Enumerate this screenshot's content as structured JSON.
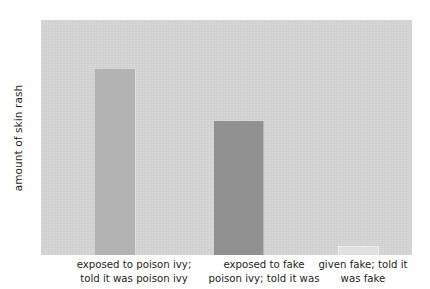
{
  "chart_data": {
    "type": "bar",
    "title": "",
    "subtitle": "",
    "xlabel": "",
    "ylabel": "amount of skin rash",
    "categories": [
      "exposed to poison ivy; told it was poison ivy",
      "exposed to fake poison ivy; told it was",
      "given fake; told it was fake"
    ],
    "values": [
      79,
      57,
      4
    ],
    "ylim": [
      0,
      100
    ],
    "grid": false,
    "legend": "none",
    "axis_tick_labels": [],
    "series": [
      {
        "name": "amount of skin rash",
        "values": [
          79,
          57,
          4
        ]
      }
    ],
    "bar_colors": [
      "#b3b3b3",
      "#919191",
      "#e0e0e0"
    ],
    "plot_background": "#d6d6d6",
    "figure_background": "#ffffff",
    "text_color": "#231f20"
  },
  "axes": {
    "y_title": "amount of skin rash"
  },
  "categories": [
    {
      "id": "poison-ivy-told-poison-ivy",
      "lines": [
        "exposed to poison ivy;",
        "told it was poison ivy"
      ],
      "value": 79,
      "color": "#b3b3b3"
    },
    {
      "id": "fake-told-poison-ivy",
      "lines": [
        "exposed to fake",
        "poison ivy; told it was"
      ],
      "value": 57,
      "color": "#919191"
    },
    {
      "id": "fake-told-fake",
      "lines": [
        "given fake; told it",
        "was fake"
      ],
      "value": 4,
      "color": "#e0e0e0"
    }
  ]
}
